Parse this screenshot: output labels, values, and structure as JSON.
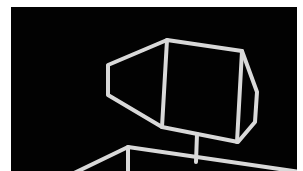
{
  "figure": {
    "background_color": "#020202",
    "line_color": "#d9d9d9",
    "border_color": "#ffffff"
  }
}
